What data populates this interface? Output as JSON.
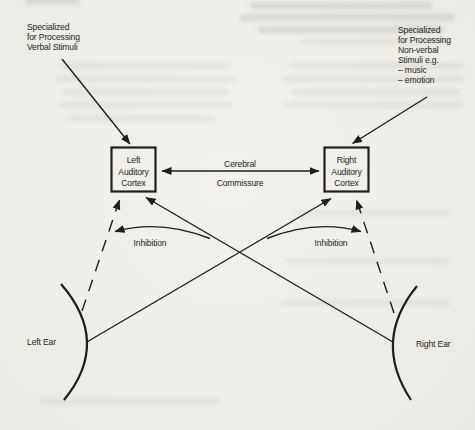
{
  "figure": {
    "background": "#f0efea",
    "ink": "#1e1e1e",
    "left_label": {
      "lines": [
        "Specialized",
        "for Processing",
        "Verbal Stimuli"
      ]
    },
    "right_label": {
      "lines": [
        "Specialized",
        "for Processing",
        "Non-verbal",
        "Stimuli e.g.",
        "– music",
        "– emotion"
      ]
    },
    "left_box": {
      "lines": [
        "Left",
        "Auditory",
        "Cortex"
      ]
    },
    "right_box": {
      "lines": [
        "Right",
        "Auditory",
        "Cortex"
      ]
    },
    "commissure": {
      "lines": [
        "Cerebral",
        "Commissure"
      ]
    },
    "inhibition_left": "Inhibition",
    "inhibition_right": "Inhibition",
    "left_ear": "Left Ear",
    "right_ear": "Right Ear"
  }
}
